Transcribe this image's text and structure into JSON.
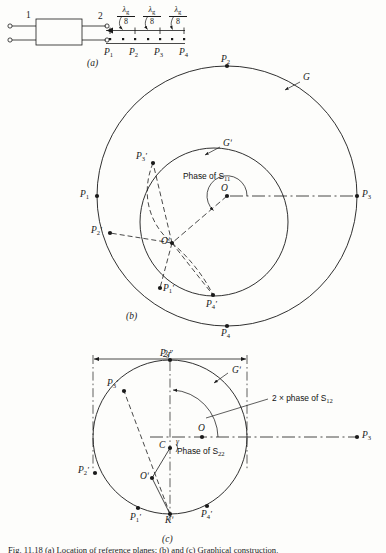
{
  "figure": {
    "caption": "Fig. 11.18  (a) Location of reference planes; (b) and (c) Graphical construction.",
    "panels": [
      {
        "id": "a",
        "label": "(a)"
      },
      {
        "id": "b",
        "label": "(b)"
      },
      {
        "id": "c",
        "label": "(c)"
      }
    ]
  },
  "panel_a": {
    "port1_label": "1",
    "port2_label": "2",
    "spacing_labels": [
      {
        "num": "λ",
        "numsub": "g",
        "den": "8"
      },
      {
        "num": "λ",
        "numsub": "g",
        "den": "8"
      },
      {
        "num": "λ",
        "numsub": "g",
        "den": "8"
      }
    ],
    "plane_labels": [
      {
        "base": "P",
        "sub": "1"
      },
      {
        "base": "P",
        "sub": "2"
      },
      {
        "base": "P",
        "sub": "3"
      },
      {
        "base": "P",
        "sub": "4"
      }
    ]
  },
  "panel_b": {
    "outer_circle_label": "G",
    "inner_circle_label": "Gʹ",
    "center_outer_label": "O",
    "center_inner_label": "Oʹ",
    "phase_annotation": "Phase of S",
    "phase_annotation_sub": "11",
    "outer_points": [
      {
        "base": "P",
        "sub": "1"
      },
      {
        "base": "P",
        "sub": "2"
      },
      {
        "base": "P",
        "sub": "3"
      },
      {
        "base": "P",
        "sub": "4"
      }
    ],
    "inner_points": [
      {
        "base": "P",
        "sub": "1",
        "prime": "ʹ"
      },
      {
        "base": "P",
        "sub": "2",
        "prime": "ʹ"
      },
      {
        "base": "P",
        "sub": "3",
        "prime": "ʹ"
      },
      {
        "base": "P",
        "sub": "4",
        "prime": "ʹ"
      }
    ]
  },
  "panel_c": {
    "diameter_label": "2r",
    "circle_label": "Gʹ",
    "center_outer_label": "O",
    "center_inner_label": "Oʹ",
    "point_c_label": "C",
    "point_k_label": "Kʹ",
    "angle_gamma_label": "γ",
    "far_point_label": "P",
    "far_point_sub": "3",
    "annotation_s12": "2 × phase of S",
    "annotation_s12_sub": "12",
    "annotation_s22": "Phase of S",
    "annotation_s22_sub": "22",
    "points": [
      {
        "base": "P",
        "sub": "1",
        "prime": "ʹ"
      },
      {
        "base": "P",
        "sub": "2",
        "prime": "ʹ"
      },
      {
        "base": "P",
        "sub": "3",
        "prime": "ʹ"
      },
      {
        "base": "P",
        "sub": "4",
        "prime": "ʹ"
      },
      {
        "base": "P",
        "sub": "3",
        "prime": "ʺ"
      }
    ]
  },
  "style": {
    "ink": "#1a1a1a",
    "paper": "#fdfdfb"
  }
}
